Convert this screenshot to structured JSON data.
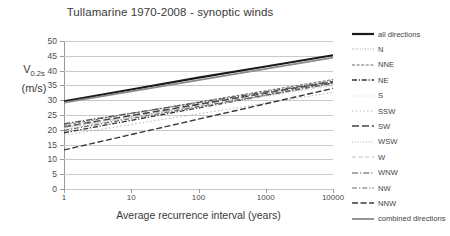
{
  "chart_data": {
    "type": "line",
    "title": "Tullamarine 1970-2008  -  synoptic winds",
    "xlabel": "Average recurrence interval (years)",
    "ylabel_main": "V",
    "ylabel_sub": "0.2s",
    "ylabel_unit": "(m/s)",
    "xscale": "log",
    "xlim": [
      1,
      10000
    ],
    "ylim": [
      0,
      50
    ],
    "yticks": [
      0,
      5,
      10,
      15,
      20,
      25,
      30,
      35,
      40,
      45,
      50
    ],
    "xticks": [
      "1",
      "10",
      "100",
      "1000",
      "10000"
    ],
    "grid": "horizontal",
    "legend_position": "right",
    "x": [
      1,
      10,
      100,
      1000,
      10000
    ],
    "series": [
      {
        "name": "all directions",
        "style": "solid-thick",
        "color": "#1a1a1a",
        "width": 2.2,
        "values": [
          29.6,
          33.6,
          37.6,
          41.4,
          45.2
        ]
      },
      {
        "name": "N",
        "style": "dotted-fine",
        "color": "#9a9a9a",
        "width": 0.9,
        "values": [
          20.0,
          24.2,
          28.4,
          32.6,
          36.8
        ]
      },
      {
        "name": "NNE",
        "style": "dashed-fine",
        "color": "#6f6f6f",
        "width": 1.0,
        "values": [
          21.6,
          25.5,
          29.4,
          33.2,
          37.0
        ]
      },
      {
        "name": "NE",
        "style": "dash-dot",
        "color": "#2f2f2f",
        "width": 1.3,
        "values": [
          19.0,
          23.2,
          27.4,
          31.6,
          35.8
        ]
      },
      {
        "name": "S",
        "style": "dotted-faint",
        "color": "#cfcfcf",
        "width": 0.9,
        "values": [
          20.4,
          24.0,
          27.6,
          31.2,
          34.8
        ]
      },
      {
        "name": "SSW",
        "style": "dotted-sparse",
        "color": "#b0b0b0",
        "width": 1.0,
        "values": [
          18.2,
          21.8,
          25.4,
          29.0,
          32.6
        ]
      },
      {
        "name": "SW",
        "style": "dashed-long",
        "color": "#444444",
        "width": 1.6,
        "values": [
          21.0,
          24.8,
          28.6,
          32.4,
          36.2
        ]
      },
      {
        "name": "WSW",
        "style": "dotted-fine2",
        "color": "#a8a8a8",
        "width": 0.9,
        "values": [
          22.2,
          25.6,
          29.0,
          32.4,
          35.8
        ]
      },
      {
        "name": "W",
        "style": "dashed-light",
        "color": "#bdbdbd",
        "width": 1.0,
        "values": [
          20.8,
          24.4,
          28.0,
          31.6,
          35.2
        ]
      },
      {
        "name": "WNW",
        "style": "dash-dot-2",
        "color": "#555555",
        "width": 1.2,
        "values": [
          22.0,
          25.6,
          29.2,
          32.8,
          36.4
        ]
      },
      {
        "name": "NW",
        "style": "dash-dot-3",
        "color": "#6a6a6a",
        "width": 1.2,
        "values": [
          19.8,
          23.8,
          27.8,
          31.8,
          35.8
        ]
      },
      {
        "name": "NNW",
        "style": "dashed-wide",
        "color": "#3a3a3a",
        "width": 1.4,
        "values": [
          13.2,
          18.4,
          23.6,
          28.8,
          34.0
        ]
      },
      {
        "name": "combined directions",
        "style": "solid-med",
        "color": "#8a8a8a",
        "width": 1.8,
        "values": [
          29.2,
          33.0,
          36.8,
          40.6,
          44.4
        ]
      }
    ]
  }
}
